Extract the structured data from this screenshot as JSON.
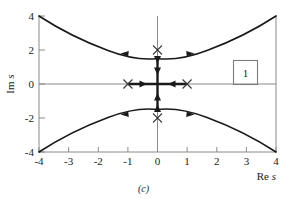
{
  "figure": {
    "caption": "(c)",
    "legend_label": "1",
    "accent_color": "#1a1a1a",
    "axis_color": "#8a8a8a"
  },
  "chart_data": {
    "type": "line",
    "title": "",
    "subtitle": "",
    "xlabel": "Re s",
    "ylabel": "Im s",
    "xlim": [
      -4,
      4
    ],
    "ylim": [
      -4,
      4
    ],
    "grid": false,
    "legend": {
      "position": "right",
      "entries": [
        "1"
      ]
    },
    "xticks": [
      -4,
      -3,
      -2,
      -1,
      0,
      1,
      2,
      3,
      4
    ],
    "xtick_labels": [
      "-4",
      "-3",
      "-2",
      "-1",
      "0",
      "1",
      "2",
      "3",
      "4"
    ],
    "yticks": [
      -4,
      -2,
      0,
      2,
      4
    ],
    "ytick_labels": [
      "-4",
      "-2",
      "0",
      "2",
      "4"
    ],
    "series": [
      {
        "name": "upper-branch",
        "comment": "root-locus asymptotic branch, minimum at (0, 1.5), endpoints (-4, 4) and (4, 4)",
        "x": [
          -4,
          -3.5,
          -3,
          -2.5,
          -2,
          -1.5,
          -1,
          -0.5,
          0,
          0.5,
          1,
          1.5,
          2,
          2.5,
          3,
          3.5,
          4
        ],
        "y": [
          4.0,
          3.53,
          3.12,
          2.74,
          2.42,
          2.12,
          1.88,
          1.68,
          1.5,
          1.68,
          1.88,
          2.12,
          2.42,
          2.74,
          3.12,
          3.53,
          4.0
        ]
      },
      {
        "name": "lower-branch",
        "comment": "mirror image below real axis, maximum at (0, -1.5)",
        "x": [
          -4,
          -3.5,
          -3,
          -2.5,
          -2,
          -1.5,
          -1,
          -0.5,
          0,
          0.5,
          1,
          1.5,
          2,
          2.5,
          3,
          3.5,
          4
        ],
        "y": [
          -4.0,
          -3.53,
          -3.12,
          -2.74,
          -2.42,
          -2.12,
          -1.88,
          -1.68,
          -1.5,
          -1.68,
          -1.88,
          -2.12,
          -2.42,
          -2.74,
          -3.12,
          -3.53,
          -4.0
        ]
      },
      {
        "name": "real-axis-segment",
        "comment": "locus along real axis between the two open-loop poles",
        "x": [
          -1,
          1
        ],
        "y": [
          0,
          0
        ]
      },
      {
        "name": "imaginary-axis-segment",
        "comment": "locus along imaginary axis between -1.5 and 1.5",
        "x": [
          0,
          0
        ],
        "y": [
          -1.5,
          1.5
        ]
      }
    ],
    "markers": [
      {
        "type": "x",
        "label": "pole",
        "x": -1,
        "y": 0
      },
      {
        "type": "x",
        "label": "pole",
        "x": 1,
        "y": 0
      },
      {
        "type": "x",
        "label": "pole",
        "x": 0,
        "y": 2
      },
      {
        "type": "x",
        "label": "pole",
        "x": 0,
        "y": -2
      }
    ],
    "arrows": [
      {
        "x": -1.1,
        "y": 1.85,
        "direction": "left",
        "on": "upper-branch"
      },
      {
        "x": 1.1,
        "y": 1.85,
        "direction": "right",
        "on": "upper-branch"
      },
      {
        "x": -1.1,
        "y": -1.85,
        "direction": "left",
        "on": "lower-branch"
      },
      {
        "x": 1.1,
        "y": -1.85,
        "direction": "right",
        "on": "lower-branch"
      },
      {
        "x": -0.62,
        "y": 0,
        "direction": "right",
        "on": "real-axis-segment"
      },
      {
        "x": 0.62,
        "y": 0,
        "direction": "left",
        "on": "real-axis-segment"
      },
      {
        "x": 0,
        "y": 0.62,
        "direction": "down",
        "on": "imaginary-axis-segment"
      },
      {
        "x": 0,
        "y": -0.62,
        "direction": "up",
        "on": "imaginary-axis-segment"
      },
      {
        "x": 0,
        "y": 1.42,
        "direction": "down",
        "on": "imaginary-axis-segment"
      },
      {
        "x": 0,
        "y": -1.42,
        "direction": "up",
        "on": "imaginary-axis-segment"
      }
    ]
  }
}
